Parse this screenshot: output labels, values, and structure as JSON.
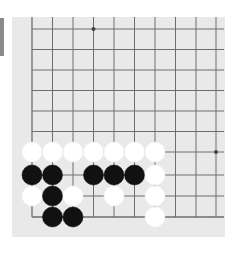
{
  "game": {
    "type": "go",
    "view": "bottom-left corner",
    "colors": {
      "board": "#e9e9e9",
      "line": "#6e6e6e",
      "black_stone": "#111111",
      "white_stone": "#ffffff",
      "tab": "#8a8a8a"
    },
    "grid": {
      "columns_x": [
        32,
        52.5,
        73,
        93.5,
        114,
        134.5,
        155,
        175.5,
        196,
        216
      ],
      "rows_y": [
        29,
        49.5,
        70,
        90.5,
        111,
        131.5,
        152,
        175,
        196,
        217
      ],
      "spacing": 20.5
    },
    "star_points": [
      {
        "col": 3,
        "row": 0
      },
      {
        "col": 9,
        "row": 6
      }
    ],
    "stones": [
      {
        "color": "white",
        "col": 0,
        "row": 6
      },
      {
        "color": "white",
        "col": 1,
        "row": 6
      },
      {
        "color": "white",
        "col": 2,
        "row": 6
      },
      {
        "color": "white",
        "col": 3,
        "row": 6
      },
      {
        "color": "white",
        "col": 4,
        "row": 6
      },
      {
        "color": "white",
        "col": 5,
        "row": 6
      },
      {
        "color": "white",
        "col": 6,
        "row": 6
      },
      {
        "color": "black",
        "col": 0,
        "row": 7
      },
      {
        "color": "black",
        "col": 1,
        "row": 7
      },
      {
        "color": "black",
        "col": 3,
        "row": 7
      },
      {
        "color": "black",
        "col": 4,
        "row": 7
      },
      {
        "color": "black",
        "col": 5,
        "row": 7
      },
      {
        "color": "white",
        "col": 6,
        "row": 7
      },
      {
        "color": "white",
        "col": 0,
        "row": 8
      },
      {
        "color": "black",
        "col": 1,
        "row": 8
      },
      {
        "color": "white",
        "col": 2,
        "row": 8
      },
      {
        "color": "white",
        "col": 4,
        "row": 8
      },
      {
        "color": "white",
        "col": 6,
        "row": 8
      },
      {
        "color": "black",
        "col": 1,
        "row": 9
      },
      {
        "color": "black",
        "col": 2,
        "row": 9
      },
      {
        "color": "white",
        "col": 6,
        "row": 9
      }
    ]
  }
}
